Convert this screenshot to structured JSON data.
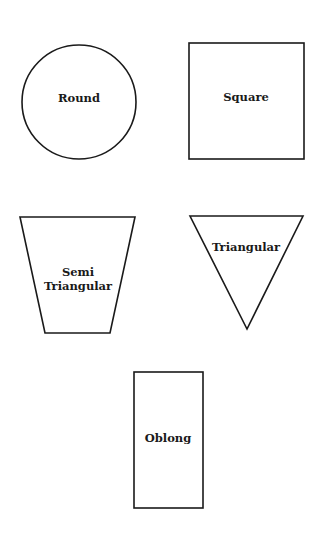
{
  "diagram": {
    "shapes": [
      {
        "id": "round",
        "label": "Round",
        "type": "circle"
      },
      {
        "id": "square",
        "label": "Square",
        "type": "square"
      },
      {
        "id": "semi_triangular",
        "label_line1": "Semi",
        "label_line2": "Triangular",
        "type": "trapezoid"
      },
      {
        "id": "triangular",
        "label": "Triangular",
        "type": "inverted-triangle"
      },
      {
        "id": "oblong",
        "label": "Oblong",
        "type": "rectangle"
      }
    ],
    "stroke_color": "#1a1a1a",
    "background_color": "#ffffff"
  }
}
